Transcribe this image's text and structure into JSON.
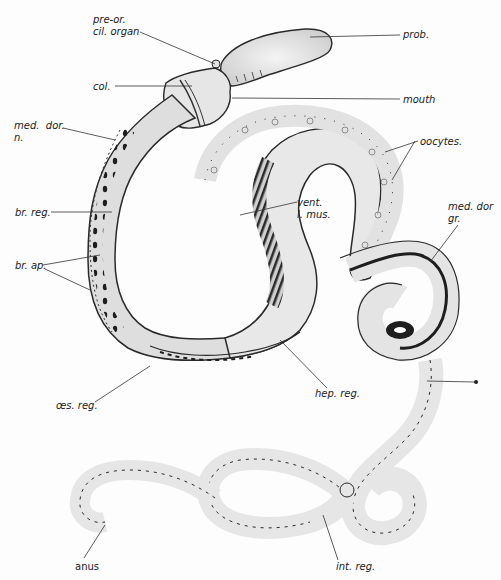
{
  "figure": {
    "colors": {
      "body_fill": "#ececec",
      "body_outline": "#2a2a2a",
      "dark_band": "#3a3a3a",
      "label_text": "#1a1a1a",
      "leader_line": "#333333",
      "background": "#fdfdfd"
    },
    "labels": [
      {
        "id": "pre-or-cil-organ",
        "text": "pre-or.\ncil. organ",
        "x": 93,
        "y": 14
      },
      {
        "id": "prob",
        "text": "prob.",
        "x": 403,
        "y": 29
      },
      {
        "id": "col",
        "text": "col.",
        "x": 93,
        "y": 81
      },
      {
        "id": "mouth",
        "text": "mouth",
        "x": 403,
        "y": 94
      },
      {
        "id": "med-dor-n",
        "text": "med.  dor.\nn.",
        "x": 14,
        "y": 120
      },
      {
        "id": "oocytes",
        "text": "oocytes.",
        "x": 420,
        "y": 136
      },
      {
        "id": "br-reg",
        "text": "br. reg.",
        "x": 15,
        "y": 207
      },
      {
        "id": "vent-l-mus",
        "text": "vent.\nl. mus.",
        "x": 297,
        "y": 197
      },
      {
        "id": "med-dor-gr",
        "text": "med. dor\ngr.",
        "x": 448,
        "y": 201
      },
      {
        "id": "br-ap",
        "text": "br. ap.",
        "x": 15,
        "y": 260
      },
      {
        "id": "oes-reg",
        "text": "œs. reg.",
        "x": 56,
        "y": 404
      },
      {
        "id": "hep-reg",
        "text": "hep. reg.",
        "x": 315,
        "y": 388
      },
      {
        "id": "int-reg",
        "text": "int. reg.",
        "x": 336,
        "y": 561
      },
      {
        "id": "anus",
        "text": "anus",
        "x": 75,
        "y": 561
      }
    ]
  }
}
